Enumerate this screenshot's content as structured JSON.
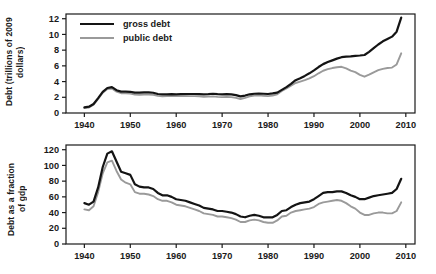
{
  "figure": {
    "background": "#ffffff",
    "panels": 2
  },
  "colors": {
    "gross_debt": "#141414",
    "public_debt": "#9a9a9a",
    "axis": "#1a1a1a",
    "text": "#1a1a1a"
  },
  "legend": {
    "position": "top-left",
    "entries": [
      {
        "label": "gross debt",
        "color": "#141414"
      },
      {
        "label": "public debt",
        "color": "#9a9a9a"
      }
    ],
    "gross_label": "gross debt",
    "public_label": "public debt"
  },
  "panel_top": {
    "ylabel_line1": "Debt (trillions of 2009",
    "ylabel_line2": "dollars)",
    "ylabel": "Debt (trillions of 2009 dollars)",
    "xticks": [
      "1940",
      "1950",
      "1960",
      "1970",
      "1980",
      "1990",
      "2000",
      "2010"
    ],
    "yticks": [
      "0",
      "2",
      "4",
      "6",
      "8",
      "10",
      "12"
    ]
  },
  "panel_bottom": {
    "ylabel_line1": "Debt as a fraction",
    "ylabel_line2": "of gdp",
    "ylabel": "Debt as a fraction of gdp",
    "xticks": [
      "1940",
      "1950",
      "1960",
      "1970",
      "1980",
      "1990",
      "2000",
      "2010"
    ],
    "yticks": [
      "0",
      "20",
      "40",
      "60",
      "80",
      "100",
      "120"
    ]
  },
  "chart_data": [
    {
      "type": "line",
      "title": "",
      "xlabel": "",
      "ylabel": "Debt (trillions of 2009 dollars)",
      "xlim": [
        1936,
        2012
      ],
      "ylim": [
        0,
        12.6
      ],
      "xticks": [
        1940,
        1950,
        1960,
        1970,
        1980,
        1990,
        2000,
        2010
      ],
      "yticks": [
        0,
        2,
        4,
        6,
        8,
        10,
        12
      ],
      "grid": false,
      "legend_position": "upper left",
      "x": [
        1940,
        1941,
        1942,
        1943,
        1944,
        1945,
        1946,
        1947,
        1948,
        1949,
        1950,
        1951,
        1952,
        1953,
        1954,
        1955,
        1956,
        1957,
        1958,
        1959,
        1960,
        1961,
        1962,
        1963,
        1964,
        1965,
        1966,
        1967,
        1968,
        1969,
        1970,
        1971,
        1972,
        1973,
        1974,
        1975,
        1976,
        1977,
        1978,
        1979,
        1980,
        1981,
        1982,
        1983,
        1984,
        1985,
        1986,
        1987,
        1988,
        1989,
        1990,
        1991,
        1992,
        1993,
        1994,
        1995,
        1996,
        1997,
        1998,
        1999,
        2000,
        2001,
        2002,
        2003,
        2004,
        2005,
        2006,
        2007,
        2008,
        2009
      ],
      "series": [
        {
          "name": "gross debt",
          "color": "#141414",
          "values": [
            0.72,
            0.8,
            1.15,
            1.9,
            2.7,
            3.18,
            3.3,
            2.9,
            2.72,
            2.72,
            2.7,
            2.6,
            2.6,
            2.62,
            2.62,
            2.58,
            2.42,
            2.36,
            2.38,
            2.4,
            2.38,
            2.4,
            2.42,
            2.42,
            2.42,
            2.4,
            2.38,
            2.4,
            2.45,
            2.4,
            2.38,
            2.4,
            2.38,
            2.28,
            2.12,
            2.22,
            2.38,
            2.45,
            2.48,
            2.45,
            2.42,
            2.5,
            2.6,
            2.95,
            3.3,
            3.72,
            4.18,
            4.42,
            4.72,
            5.05,
            5.42,
            5.85,
            6.22,
            6.48,
            6.7,
            6.92,
            7.1,
            7.18,
            7.2,
            7.28,
            7.32,
            7.38,
            7.78,
            8.25,
            8.72,
            9.12,
            9.42,
            9.72,
            10.35,
            12.15
          ]
        },
        {
          "name": "public debt",
          "color": "#9a9a9a",
          "values": [
            0.62,
            0.7,
            1.05,
            1.8,
            2.58,
            3.05,
            3.12,
            2.72,
            2.52,
            2.5,
            2.48,
            2.35,
            2.32,
            2.35,
            2.35,
            2.32,
            2.18,
            2.12,
            2.15,
            2.18,
            2.15,
            2.15,
            2.18,
            2.15,
            2.15,
            2.12,
            2.05,
            2.08,
            2.12,
            2.05,
            2.02,
            2.05,
            2.02,
            1.92,
            1.78,
            1.92,
            2.12,
            2.22,
            2.25,
            2.2,
            2.15,
            2.22,
            2.38,
            2.8,
            3.12,
            3.48,
            3.82,
            4.0,
            4.18,
            4.4,
            4.68,
            5.05,
            5.38,
            5.58,
            5.72,
            5.82,
            5.88,
            5.68,
            5.4,
            5.2,
            4.85,
            4.62,
            4.88,
            5.18,
            5.45,
            5.62,
            5.72,
            5.78,
            6.18,
            7.6
          ]
        }
      ]
    },
    {
      "type": "line",
      "title": "",
      "xlabel": "",
      "ylabel": "Debt as a fraction of gdp",
      "xlim": [
        1936,
        2012
      ],
      "ylim": [
        0,
        126
      ],
      "xticks": [
        1940,
        1950,
        1960,
        1970,
        1980,
        1990,
        2000,
        2010
      ],
      "yticks": [
        0,
        20,
        40,
        60,
        80,
        100,
        120
      ],
      "grid": false,
      "legend_position": "none",
      "x": [
        1940,
        1941,
        1942,
        1943,
        1944,
        1945,
        1946,
        1947,
        1948,
        1949,
        1950,
        1951,
        1952,
        1953,
        1954,
        1955,
        1956,
        1957,
        1958,
        1959,
        1960,
        1961,
        1962,
        1963,
        1964,
        1965,
        1966,
        1967,
        1968,
        1969,
        1970,
        1971,
        1972,
        1973,
        1974,
        1975,
        1976,
        1977,
        1978,
        1979,
        1980,
        1981,
        1982,
        1983,
        1984,
        1985,
        1986,
        1987,
        1988,
        1989,
        1990,
        1991,
        1992,
        1993,
        1994,
        1995,
        1996,
        1997,
        1998,
        1999,
        2000,
        2001,
        2002,
        2003,
        2004,
        2005,
        2006,
        2007,
        2008,
        2009
      ],
      "series": [
        {
          "name": "gross debt",
          "color": "#141414",
          "values": [
            52,
            50,
            54,
            72,
            98,
            115,
            118,
            105,
            92,
            90,
            88,
            76,
            73,
            72,
            72,
            70,
            65,
            62,
            62,
            60,
            57,
            56,
            55,
            53,
            51,
            49,
            46,
            45,
            44,
            42,
            42,
            41,
            40,
            38,
            35,
            34,
            36,
            37,
            36,
            34,
            34,
            34,
            37,
            42,
            43,
            47,
            50,
            52,
            53,
            54,
            57,
            61,
            65,
            66,
            66,
            67,
            67,
            65,
            62,
            60,
            57,
            57,
            59,
            61,
            62,
            63,
            64,
            65,
            70,
            83
          ]
        },
        {
          "name": "public debt",
          "color": "#9a9a9a",
          "values": [
            44,
            43,
            48,
            66,
            90,
            104,
            106,
            93,
            82,
            78,
            76,
            66,
            64,
            64,
            63,
            61,
            57,
            55,
            55,
            53,
            50,
            49,
            48,
            46,
            44,
            42,
            39,
            38,
            37,
            35,
            35,
            34,
            33,
            31,
            28,
            28,
            30,
            31,
            30,
            28,
            27,
            27,
            30,
            35,
            36,
            40,
            42,
            43,
            44,
            45,
            47,
            51,
            53,
            54,
            55,
            56,
            55,
            52,
            48,
            45,
            40,
            37,
            37,
            39,
            40,
            40,
            39,
            39,
            42,
            53
          ]
        }
      ]
    }
  ]
}
